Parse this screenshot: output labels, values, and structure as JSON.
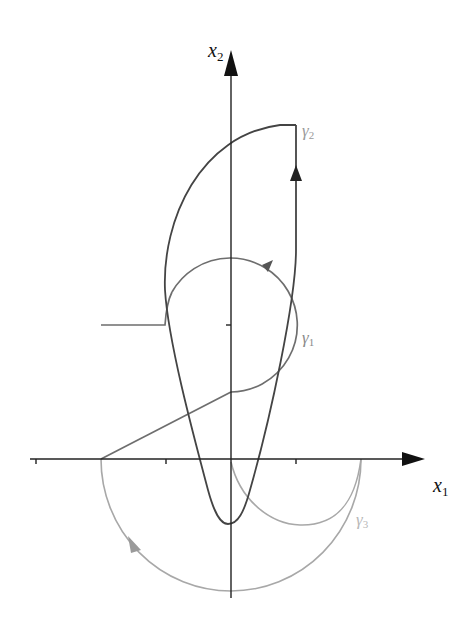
{
  "diagram": {
    "type": "phase-plane",
    "axes": {
      "x_label": "x",
      "x_sub": "1",
      "y_label": "x",
      "y_sub": "2",
      "x_ticks": 3,
      "y_ticks": 1
    },
    "curves": [
      {
        "id": "gamma1",
        "label": "γ",
        "label_sub": "1",
        "description": "circle around tick on x2-axis, counterclockwise arrow, connected to horizontal line at left and line to x1-axis",
        "color": "#6e6e6e"
      },
      {
        "id": "gamma2",
        "label": "γ",
        "label_sub": "2",
        "description": "closed curve: parabola-like bottom, vertical right edge with upward arrow, arc top",
        "color": "#4a4a4a"
      },
      {
        "id": "gamma3",
        "label": "γ",
        "label_sub": "3",
        "description": "lower semicircular arcs below x1-axis, arrow on large arc",
        "color": "#a8a8a8"
      }
    ],
    "colors": {
      "axis": "#222222",
      "gamma1": "#6e6e6e",
      "gamma2": "#4a4a4a",
      "gamma3": "#a8a8a8",
      "label_light": "#9a9a9a"
    }
  }
}
